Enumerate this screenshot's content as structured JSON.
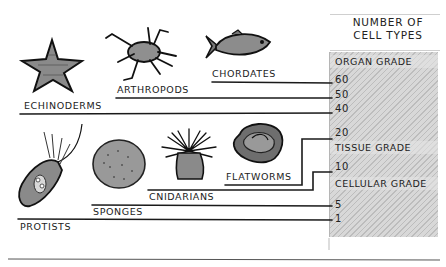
{
  "diagram": {
    "axis_title_line1": "NUMBER OF",
    "axis_title_line2": "CELL TYPES",
    "grades": {
      "organ": "ORGAN GRADE",
      "tissue": "TISSUE GRADE",
      "cellular": "CELLULAR GRADE"
    },
    "ticks": [
      "60",
      "50",
      "40",
      "20",
      "10",
      "5",
      "1"
    ],
    "groups": [
      {
        "name": "CHORDATES",
        "cell_types": "60",
        "icon": "fish-icon"
      },
      {
        "name": "ARTHROPODS",
        "cell_types": "50",
        "icon": "crab-icon"
      },
      {
        "name": "ECHINODERMS",
        "cell_types": "40",
        "icon": "starfish-icon"
      },
      {
        "name": "FLATWORMS",
        "cell_types": "20",
        "icon": "flatworm-icon"
      },
      {
        "name": "CNIDARIANS",
        "cell_types": "10",
        "icon": "sea-anemone-icon"
      },
      {
        "name": "SPONGES",
        "cell_types": "5",
        "icon": "sponge-icon"
      },
      {
        "name": "PROTISTS",
        "cell_types": "1",
        "icon": "protist-icon"
      }
    ]
  }
}
